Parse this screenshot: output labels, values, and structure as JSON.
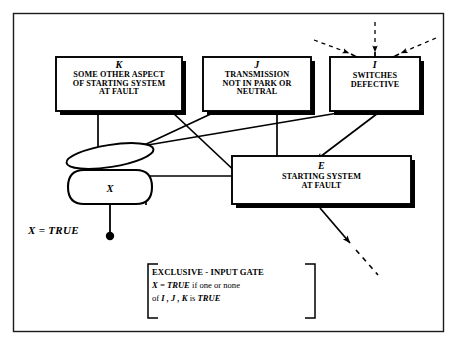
{
  "diagram": {
    "frame": {
      "name": "page-border"
    },
    "nodes": [
      {
        "id": "K",
        "ident": "K",
        "lines": [
          "SOME OTHER ASPECT",
          "OF STARTING SYSTEM",
          "AT FAULT"
        ],
        "text": "SOME OTHER ASPECT OF STARTING SYSTEM AT FAULT",
        "shape": "rect-shadow"
      },
      {
        "id": "J",
        "ident": "J",
        "lines": [
          "TRANSMISSION",
          "NOT IN PARK OR",
          "NEUTRAL"
        ],
        "text": "TRANSMISSION NOT IN PARK OR NEUTRAL",
        "shape": "rect-shadow"
      },
      {
        "id": "I",
        "ident": "I",
        "lines": [
          "SWITCHES",
          "DEFECTIVE"
        ],
        "text": "SWITCHES DEFECTIVE",
        "shape": "rect-shadow"
      },
      {
        "id": "E",
        "ident": "E",
        "lines": [
          "STARTING SYSTEM",
          "AT FAULT"
        ],
        "text": "STARTING SYSTEM AT FAULT",
        "shape": "rect-shadow"
      },
      {
        "id": "X",
        "ident": "X",
        "lines": [],
        "text": "X",
        "shape": "exclusive-input-gate"
      }
    ],
    "output_label": "X = TRUE",
    "legend": {
      "line1": "EXCLUSIVE - INPUT GATE",
      "line2_a": "X = TRUE",
      "line2_b": " if one or none",
      "line3_a": "of ",
      "line3_b": "I , J , K",
      "line3_c": " is ",
      "line3_d": "TRUE",
      "full_text": "EXCLUSIVE - INPUT GATE  X = TRUE if one or none of I, J, K is TRUE"
    },
    "colors": {
      "ink": "#000000",
      "paper": "#ffffff",
      "shadow": "#000000"
    }
  }
}
